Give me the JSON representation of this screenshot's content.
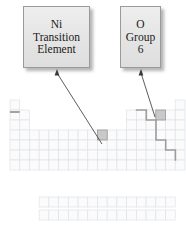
{
  "figure": {
    "kind": "periodic-table-callout-diagram",
    "callouts": [
      {
        "id": "ni",
        "lines": [
          "Ni",
          "Transition",
          "Element"
        ],
        "target_cell": {
          "period": 4,
          "group": 10
        }
      },
      {
        "id": "oxygen",
        "lines": [
          "O",
          "Group",
          "6"
        ],
        "target_cell": {
          "period": 2,
          "group": 16
        }
      }
    ]
  },
  "colors": {
    "box_fill": "#e8e8e8",
    "box_border": "#9a9a9a",
    "cell_fill": "#fbfbfc",
    "cell_border": "#dfe2e8",
    "highlight_fill": "#c9c9c9",
    "highlight_border": "#9a9a9a",
    "staircase": "#9d9d9d",
    "arrow": "#4a4a4a"
  },
  "table": {
    "origin_x": 10,
    "origin_y": 100,
    "cell_w": 9.72,
    "cell_h": 10.0,
    "rows": [
      {
        "period": 1,
        "groups": [
          1,
          18
        ]
      },
      {
        "period": 2,
        "groups": [
          1,
          2,
          13,
          14,
          15,
          16,
          17,
          18
        ]
      },
      {
        "period": 3,
        "groups": [
          1,
          2,
          13,
          14,
          15,
          16,
          17,
          18
        ]
      },
      {
        "period": 4,
        "groups": [
          1,
          2,
          3,
          4,
          5,
          6,
          7,
          8,
          9,
          10,
          11,
          12,
          13,
          14,
          15,
          16,
          17,
          18
        ]
      },
      {
        "period": 5,
        "groups": [
          1,
          2,
          3,
          4,
          5,
          6,
          7,
          8,
          9,
          10,
          11,
          12,
          13,
          14,
          15,
          16,
          17,
          18
        ]
      },
      {
        "period": 6,
        "groups": [
          1,
          2,
          3,
          4,
          5,
          6,
          7,
          8,
          9,
          10,
          11,
          12,
          13,
          14,
          15,
          16,
          17,
          18
        ]
      },
      {
        "period": 7,
        "groups": [
          1,
          2,
          3,
          4,
          5,
          6,
          7,
          8,
          9,
          10,
          11,
          12,
          13,
          14,
          15,
          16,
          17,
          18
        ]
      }
    ],
    "f_block": {
      "start_group": 4,
      "count": 14,
      "rows": [
        {
          "label": "lanthanides",
          "y_offset": 97
        },
        {
          "label": "actinides",
          "y_offset": 110
        }
      ]
    },
    "highlighted_cells": [
      {
        "name": "Ni",
        "period": 4,
        "group": 10
      },
      {
        "name": "O",
        "period": 2,
        "group": 16
      }
    ],
    "staircase_path": "M 136.6 110 L 146.3 110 L 146.3 120 L 156 120 L 156 130 L 156 140 L 165.7 140 L 165.7 150 L 175.4 150 L 175.4 160",
    "period1_underline": {
      "x1": 10,
      "x2": 19.7,
      "y": 112
    }
  },
  "arrows": [
    {
      "id": "arrow-ni",
      "from": {
        "x": 102,
        "y": 144
      },
      "to": {
        "x": 57,
        "y": 73
      },
      "head": "up"
    },
    {
      "id": "arrow-oxygen",
      "from": {
        "x": 155,
        "y": 117
      },
      "to": {
        "x": 141,
        "y": 73
      },
      "head": "up"
    }
  ]
}
